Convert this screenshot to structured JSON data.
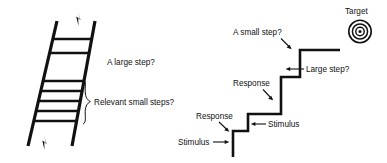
{
  "figure": {
    "title": "",
    "background_color": "#ffffff",
    "ink_color": "#111111",
    "left_panel": {
      "name": "ladder-diagram",
      "labels": {
        "large_step": "A large step?",
        "small_steps": "Relevant small steps?"
      },
      "icons": {
        "top_arrow": "up-arrow-icon",
        "bottom_arrow": "up-arrow-icon",
        "brace": "curly-brace-icon"
      },
      "rungs_total": 7,
      "wide_rungs": 2,
      "narrow_rungs": 5
    },
    "right_panel": {
      "name": "staircase-diagram",
      "labels": {
        "small_step": "A small step?",
        "large_step": "Large step?",
        "response_upper": "Response",
        "response_lower": "Response",
        "stimulus_upper": "Stimulus",
        "stimulus_lower": "Stimulus",
        "target": "Target"
      },
      "icons": {
        "target": "bullseye-icon",
        "pointer_small_step": "arrow-pointer-icon",
        "pointer_large_step": "arrow-pointer-icon",
        "pointer_response_upper": "arrow-pointer-icon",
        "pointer_response_lower": "arrow-pointer-icon",
        "pointer_stimulus_upper": "arrow-pointer-icon",
        "pointer_stimulus_lower": "arrow-pointer-icon"
      },
      "steps": 4
    }
  }
}
